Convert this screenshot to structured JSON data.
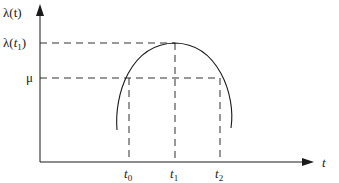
{
  "diagram": {
    "type": "curve-with-thresholds",
    "y_axis_label": "λ(t)",
    "x_axis_label": "t",
    "y_ticks": [
      {
        "id": "peak",
        "label_main": "λ(t",
        "label_sub": "1",
        "label_close": ")"
      },
      {
        "id": "mu",
        "label": "μ"
      }
    ],
    "x_ticks": [
      {
        "id": "t0",
        "label_main": "t",
        "label_sub": "0"
      },
      {
        "id": "t1",
        "label_main": "t",
        "label_sub": "1"
      },
      {
        "id": "t2",
        "label_main": "t",
        "label_sub": "2"
      }
    ],
    "curve": {
      "shape": "inverted-parabola",
      "peak_at": "t1",
      "crosses_mu_at": [
        "t0",
        "t2"
      ]
    },
    "colors": {
      "line": "#1a1a1a",
      "background": "#ffffff"
    }
  }
}
